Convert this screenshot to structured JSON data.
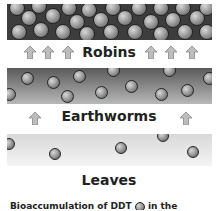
{
  "levels": [
    {
      "label": "Robins"
    },
    {
      "label": "Earthworms"
    },
    {
      "label": "Leaves"
    }
  ],
  "caption": "Bioaccumulation of DDT",
  "caption_suffix": "in the",
  "colors": {
    "robins_band": "#3d3d3d",
    "worms_band_top": "#5a5a5a",
    "leaves_band": "#e6e6e6",
    "arrow": "#b0b0b0"
  }
}
